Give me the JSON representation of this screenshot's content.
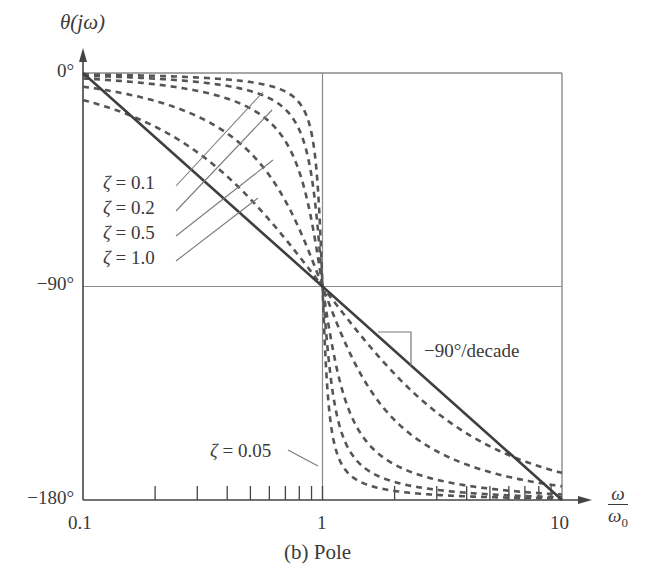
{
  "chart_data": {
    "type": "line",
    "title": "",
    "caption": "(b) Pole",
    "xlabel": "ω/ω0",
    "ylabel": "θ(jω)",
    "xscale": "log",
    "xlim": [
      0.1,
      10
    ],
    "ylim": [
      -180,
      0
    ],
    "x_ticks": [
      "0.1",
      "1",
      "10"
    ],
    "y_ticks": [
      "0°",
      "−90°",
      "−180°"
    ],
    "grid": "gridlines at x=1 and y=-90°",
    "series": [
      {
        "name": "ζ = 0.05",
        "zeta": 0.05,
        "style": "dashed"
      },
      {
        "name": "ζ = 0.1",
        "zeta": 0.1,
        "style": "dashed"
      },
      {
        "name": "ζ = 0.2",
        "zeta": 0.2,
        "style": "dashed"
      },
      {
        "name": "ζ = 0.5",
        "zeta": 0.5,
        "style": "dashed"
      },
      {
        "name": "ζ = 1.0",
        "zeta": 1.0,
        "style": "dashed"
      },
      {
        "name": "Asymptote",
        "style": "solid",
        "x": [
          0.1,
          10
        ],
        "y": [
          0,
          -180
        ]
      }
    ],
    "annotations": [
      {
        "text": "ζ = 0.1",
        "points_to": "ζ = 0.1 curve"
      },
      {
        "text": "ζ = 0.2",
        "points_to": "ζ = 0.2 curve"
      },
      {
        "text": "ζ = 0.5",
        "points_to": "ζ = 0.5 curve"
      },
      {
        "text": "ζ = 1.0",
        "points_to": "ζ = 1.0 curve"
      },
      {
        "text": "ζ = 0.05",
        "points_to": "ζ = 0.05 curve"
      },
      {
        "text": "−90°/decade",
        "points_to": "asymptote slope"
      }
    ]
  },
  "labels": {
    "ylabel": "θ(jω)",
    "y0": "0°",
    "y90": "−90°",
    "y180": "−180°",
    "x01": "0.1",
    "x1": "1",
    "x10": "10",
    "xnum": "ω",
    "xden": "ω",
    "xden_sub": "0",
    "slope": "−90°/decade",
    "caption": "(b) Pole",
    "zeta_sym": "ζ",
    "z01": " = 0.1",
    "z02": " = 0.2",
    "z05": " = 0.5",
    "z10": " = 1.0",
    "z005": " = 0.05"
  }
}
